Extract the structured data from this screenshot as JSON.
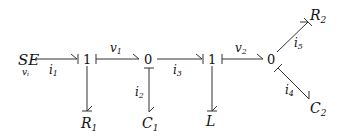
{
  "diagram": {
    "type": "bond-graph",
    "nodes": {
      "source": {
        "label": "SE",
        "sub": "v",
        "subsub": "i"
      },
      "j1a": {
        "label": "1"
      },
      "j0a": {
        "label": "0"
      },
      "j1b": {
        "label": "1"
      },
      "j0b": {
        "label": "0"
      },
      "R1": {
        "label": "R",
        "sub": "1"
      },
      "C1": {
        "label": "C",
        "sub": "1"
      },
      "L": {
        "label": "L"
      },
      "R2": {
        "label": "R",
        "sub": "2"
      },
      "C2": {
        "label": "C",
        "sub": "2"
      }
    },
    "bonds": {
      "i1": {
        "label": "i",
        "sub": "1"
      },
      "v1": {
        "label": "v",
        "sub": "1"
      },
      "i3": {
        "label": "i",
        "sub": "3"
      },
      "v2": {
        "label": "v",
        "sub": "2"
      },
      "i2": {
        "label": "i",
        "sub": "2"
      },
      "i5": {
        "label": "i",
        "sub": "5"
      },
      "i4": {
        "label": "i",
        "sub": "4"
      }
    }
  }
}
